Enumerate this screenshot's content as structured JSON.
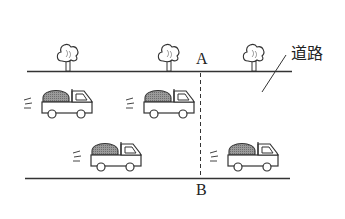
{
  "diagram": {
    "labels": {
      "point_a": "A",
      "point_b": "B",
      "road": "道路"
    },
    "elements": {
      "trees": 3,
      "trucks": 4,
      "road_edges": 2,
      "dashed_line": "A–B"
    },
    "colors": {
      "line": "#333333",
      "cargo_fill": "#8c8c8c",
      "background": "#ffffff"
    }
  }
}
